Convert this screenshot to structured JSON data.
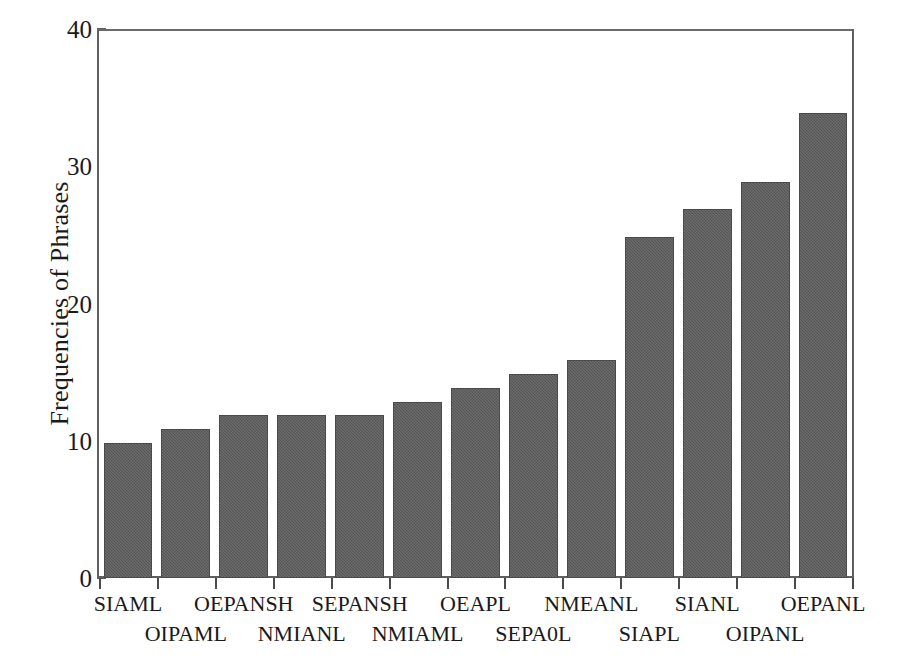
{
  "chart_data": {
    "type": "bar",
    "title": "",
    "subtitle": "",
    "xlabel": "",
    "ylabel": "Frequencies of Phrases",
    "categories": [
      "SIAML",
      "OIPAML",
      "OEPANSH",
      "NMIANL",
      "SEPANSH",
      "NMIAML",
      "OEAPL",
      "SEPA0L",
      "NMEANL",
      "SIAPL",
      "SIANL",
      "OIPANL",
      "OEPANL"
    ],
    "values": [
      10,
      11,
      12,
      12,
      12,
      13,
      14,
      15,
      16,
      25,
      27,
      29,
      34
    ],
    "ylim": [
      0,
      40
    ],
    "xlim": [
      0,
      13
    ],
    "y_ticks": [
      0,
      10,
      20,
      30,
      40
    ],
    "y_tick_labels": [
      "0",
      "10",
      "20",
      "30",
      "40"
    ],
    "grid": false,
    "legend": null,
    "legend_position": "none",
    "bar_color": "#5c5c5c",
    "bar_edge_color": "#4a4a4a",
    "axis_color": "#5f5f5f",
    "background_color": "#ffffff",
    "x_label_layout": "staggered-two-rows",
    "annotations": []
  },
  "axes": {
    "y_title": "Frequencies of Phrases"
  }
}
